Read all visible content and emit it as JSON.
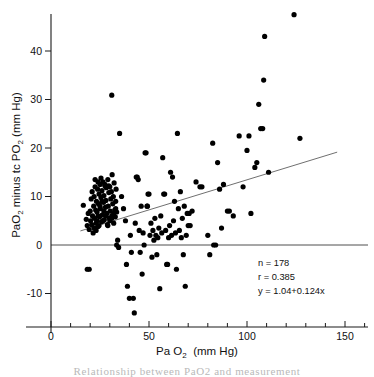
{
  "chart_data": {
    "type": "scatter",
    "title": "",
    "xlabel": "Pa O2  (mm Hg)",
    "ylabel": "PaO2  minus  tc PO2  (mm Hg)",
    "xlabel_parts": {
      "main": "Pa O",
      "sub": "2",
      "units": "(mm Hg)"
    },
    "ylabel_parts": {
      "p1": "PaO",
      "s1": "2",
      "p2": " minus ",
      "p3": "tc PO",
      "s2": "2",
      "units": " (mm Hg)"
    },
    "xlim": [
      -5,
      165
    ],
    "ylim": [
      -17,
      49
    ],
    "xticks": [
      0,
      50,
      100,
      150
    ],
    "xticklabels": [
      "0",
      "50",
      "100",
      "150"
    ],
    "xminorticks": [
      10,
      20,
      30,
      40,
      60,
      70,
      80,
      90,
      110,
      120,
      130,
      140,
      160
    ],
    "yticks": [
      -10,
      0,
      10,
      20,
      30,
      40
    ],
    "yticklabels": [
      "-10",
      "0",
      "10",
      "20",
      "30",
      "40"
    ],
    "grid": false,
    "legend": "none",
    "zero_reference_line": 0,
    "fit_line": {
      "intercept": 1.04,
      "slope": 0.124,
      "x_start": 15,
      "x_end": 146,
      "color": "#555555"
    },
    "annotations": [
      {
        "name": "sample-size",
        "text": "n = 178"
      },
      {
        "name": "correlation",
        "text": "r = 0.385"
      },
      {
        "name": "regression-equation",
        "text": "y = 1.04+0.124x"
      }
    ],
    "marker": {
      "shape": "circle",
      "size": 2.6,
      "color": "#000000"
    },
    "points": [
      [
        16.5,
        8.2
      ],
      [
        18.0,
        5.3
      ],
      [
        18.5,
        4.0
      ],
      [
        19.0,
        6.5
      ],
      [
        19.5,
        3.2
      ],
      [
        20.0,
        7.0
      ],
      [
        20.2,
        5.0
      ],
      [
        20.5,
        9.5
      ],
      [
        20.8,
        4.2
      ],
      [
        21.0,
        11.0
      ],
      [
        21.2,
        6.0
      ],
      [
        21.5,
        2.5
      ],
      [
        21.8,
        8.0
      ],
      [
        22.0,
        10.0
      ],
      [
        22.2,
        5.5
      ],
      [
        22.5,
        12.0
      ],
      [
        22.8,
        7.2
      ],
      [
        23.0,
        4.5
      ],
      [
        23.2,
        9.0
      ],
      [
        23.5,
        6.8
      ],
      [
        23.8,
        11.5
      ],
      [
        24.0,
        3.8
      ],
      [
        24.2,
        8.5
      ],
      [
        24.5,
        10.5
      ],
      [
        24.8,
        5.8
      ],
      [
        25.0,
        12.5
      ],
      [
        25.2,
        7.5
      ],
      [
        25.5,
        9.8
      ],
      [
        25.8,
        4.8
      ],
      [
        26.0,
        11.2
      ],
      [
        26.2,
        6.2
      ],
      [
        26.5,
        13.0
      ],
      [
        26.8,
        8.8
      ],
      [
        27.0,
        10.2
      ],
      [
        27.2,
        5.2
      ],
      [
        27.5,
        12.2
      ],
      [
        27.8,
        7.8
      ],
      [
        28.0,
        9.2
      ],
      [
        28.2,
        11.8
      ],
      [
        28.5,
        6.5
      ],
      [
        28.8,
        4.2
      ],
      [
        29.0,
        13.5
      ],
      [
        29.2,
        8.0
      ],
      [
        29.5,
        10.8
      ],
      [
        29.8,
        5.5
      ],
      [
        30.0,
        12.0
      ],
      [
        30.2,
        7.0
      ],
      [
        30.5,
        9.5
      ],
      [
        30.8,
        11.0
      ],
      [
        31.0,
        6.0
      ],
      [
        31.2,
        14.5
      ],
      [
        31.5,
        8.5
      ],
      [
        31.8,
        10.0
      ],
      [
        32.0,
        4.5
      ],
      [
        32.2,
        12.8
      ],
      [
        32.5,
        7.2
      ],
      [
        32.8,
        5.8
      ],
      [
        33.0,
        9.0
      ],
      [
        33.2,
        11.5
      ],
      [
        33.5,
        6.8
      ],
      [
        23.5,
        5.0
      ],
      [
        24.0,
        6.0
      ],
      [
        25.0,
        8.0
      ],
      [
        26.0,
        9.0
      ],
      [
        27.0,
        7.0
      ],
      [
        22.0,
        3.5
      ],
      [
        23.0,
        3.0
      ],
      [
        24.5,
        4.0
      ],
      [
        26.5,
        5.0
      ],
      [
        28.0,
        6.0
      ],
      [
        29.0,
        4.0
      ],
      [
        30.0,
        5.0
      ],
      [
        31.0,
        5.5
      ],
      [
        32.0,
        6.5
      ],
      [
        33.0,
        7.5
      ],
      [
        22.5,
        13.5
      ],
      [
        24.0,
        13.0
      ],
      [
        25.5,
        13.8
      ],
      [
        27.5,
        12.5
      ],
      [
        29.5,
        12.2
      ],
      [
        31.0,
        30.9
      ],
      [
        33.5,
        0.0
      ],
      [
        34.0,
        1.0
      ],
      [
        34.5,
        -0.5
      ],
      [
        18.5,
        -5.0
      ],
      [
        19.5,
        -5.0
      ],
      [
        35.0,
        23.0
      ],
      [
        36.0,
        10.0
      ],
      [
        37.0,
        7.5
      ],
      [
        38.0,
        5.0
      ],
      [
        38.5,
        -4.0
      ],
      [
        39.0,
        -8.5
      ],
      [
        40.0,
        -11.0
      ],
      [
        40.5,
        2.0
      ],
      [
        41.0,
        -1.5
      ],
      [
        42.0,
        -11.0
      ],
      [
        42.5,
        -14.0
      ],
      [
        43.0,
        4.5
      ],
      [
        43.5,
        14.0
      ],
      [
        44.0,
        14.0
      ],
      [
        44.5,
        13.5
      ],
      [
        45.0,
        3.0
      ],
      [
        45.5,
        -1.5
      ],
      [
        46.0,
        8.0
      ],
      [
        46.5,
        -6.0
      ],
      [
        47.0,
        2.5
      ],
      [
        47.5,
        0.0
      ],
      [
        48.0,
        19.0
      ],
      [
        48.5,
        19.0
      ],
      [
        49.0,
        8.0
      ],
      [
        49.2,
        8.0
      ],
      [
        49.5,
        10.5
      ],
      [
        50.0,
        10.5
      ],
      [
        50.5,
        2.0
      ],
      [
        51.0,
        4.5
      ],
      [
        51.5,
        -2.5
      ],
      [
        52.0,
        3.0
      ],
      [
        52.5,
        1.0
      ],
      [
        53.0,
        5.5
      ],
      [
        53.5,
        2.0
      ],
      [
        54.0,
        -2.0
      ],
      [
        54.5,
        1.5
      ],
      [
        55.0,
        3.5
      ],
      [
        55.5,
        -9.0
      ],
      [
        56.0,
        6.0
      ],
      [
        56.5,
        2.5
      ],
      [
        57.0,
        18.0
      ],
      [
        57.5,
        10.5
      ],
      [
        58.0,
        10.5
      ],
      [
        58.5,
        3.0
      ],
      [
        59.0,
        -4.0
      ],
      [
        59.5,
        -4.0
      ],
      [
        60.0,
        1.5
      ],
      [
        60.5,
        4.0
      ],
      [
        61.0,
        15.0
      ],
      [
        61.5,
        2.0
      ],
      [
        62.0,
        14.0
      ],
      [
        62.5,
        5.0
      ],
      [
        63.0,
        9.0
      ],
      [
        63.5,
        2.5
      ],
      [
        64.0,
        -5.0
      ],
      [
        64.5,
        23.0
      ],
      [
        65.0,
        7.5
      ],
      [
        65.5,
        3.0
      ],
      [
        66.0,
        11.0
      ],
      [
        66.5,
        1.5
      ],
      [
        67.0,
        5.5
      ],
      [
        67.5,
        -2.0
      ],
      [
        68.0,
        8.0
      ],
      [
        68.5,
        -8.5
      ],
      [
        69.0,
        2.0
      ],
      [
        69.5,
        6.5
      ],
      [
        70.0,
        4.0
      ],
      [
        70.5,
        6.5
      ],
      [
        71.0,
        4.0
      ],
      [
        72.0,
        7.0
      ],
      [
        74.0,
        13.0
      ],
      [
        76.0,
        12.0
      ],
      [
        77.0,
        12.0
      ],
      [
        80.0,
        2.0
      ],
      [
        81.0,
        -2.0
      ],
      [
        82.5,
        21.0
      ],
      [
        83.0,
        0.0
      ],
      [
        84.0,
        0.0
      ],
      [
        85.0,
        17.0
      ],
      [
        86.0,
        11.5
      ],
      [
        87.0,
        3.5
      ],
      [
        88.0,
        12.5
      ],
      [
        90.0,
        7.0
      ],
      [
        91.0,
        7.0
      ],
      [
        93.0,
        6.0
      ],
      [
        96.0,
        22.5
      ],
      [
        98.0,
        12.0
      ],
      [
        100.0,
        19.5
      ],
      [
        101.0,
        22.5
      ],
      [
        102.0,
        6.5
      ],
      [
        104.0,
        16.0
      ],
      [
        105.0,
        17.0
      ],
      [
        106.0,
        29.0
      ],
      [
        107.0,
        24.0
      ],
      [
        108.0,
        24.0
      ],
      [
        108.5,
        34.0
      ],
      [
        109.0,
        43.0
      ],
      [
        111.0,
        15.0
      ],
      [
        124.0,
        47.5
      ],
      [
        127.0,
        22.0
      ]
    ]
  },
  "caption": {
    "text": "Relationship between PaO2 and measurement"
  }
}
